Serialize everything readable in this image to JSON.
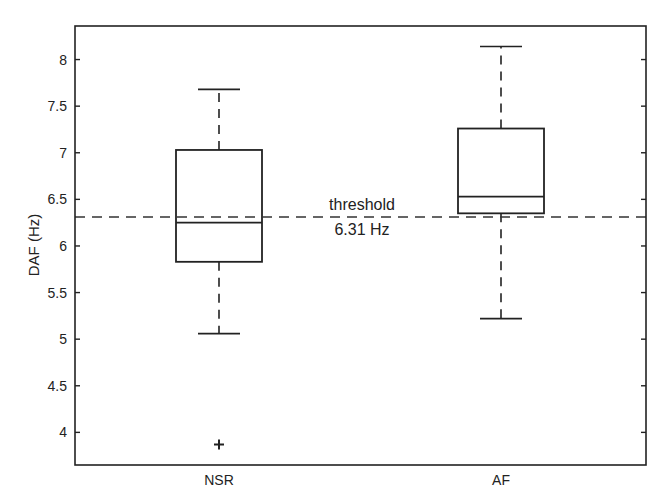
{
  "chart_data": {
    "type": "boxplot",
    "title": "",
    "xlabel": "",
    "ylabel": "DAF (Hz)",
    "ylim": [
      3.65,
      8.36
    ],
    "yticks": [
      4,
      4.5,
      5,
      5.5,
      6,
      6.5,
      7,
      7.5,
      8
    ],
    "ytick_labels": [
      "4",
      "4.5",
      "5",
      "5.5",
      "6",
      "6.5",
      "7",
      "7.5",
      "8"
    ],
    "categories": [
      "NSR",
      "AF"
    ],
    "grid": false,
    "legend": null,
    "boxes": [
      {
        "name": "NSR",
        "whisker_low": 5.06,
        "q1": 5.83,
        "median": 6.25,
        "q3": 7.03,
        "whisker_high": 7.68,
        "outliers": [
          3.87
        ]
      },
      {
        "name": "AF",
        "whisker_low": 5.22,
        "q1": 6.35,
        "median": 6.53,
        "q3": 7.26,
        "whisker_high": 8.14,
        "outliers": []
      }
    ],
    "reference_line": {
      "value": 6.31,
      "style": "dashed",
      "label_line1": "threshold",
      "label_line2": "6.31 Hz"
    },
    "colors": {
      "box": "#222222",
      "line": "#333333",
      "background": "#ffffff"
    }
  }
}
